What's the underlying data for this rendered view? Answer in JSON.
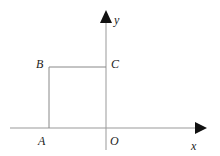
{
  "diagram": {
    "type": "coordinate-plane-square",
    "axes": {
      "x_label": "x",
      "y_label": "y",
      "origin_label": "O"
    },
    "points": [
      {
        "name": "A",
        "label": "A",
        "position": "on negative x-axis"
      },
      {
        "name": "B",
        "label": "B",
        "position": "upper-left vertex"
      },
      {
        "name": "C",
        "label": "C",
        "position": "on positive y-axis"
      },
      {
        "name": "O",
        "label": "O",
        "position": "origin"
      }
    ],
    "shape": "square ABCO",
    "colors": {
      "line": "#888888",
      "axis": "#999999",
      "arrow": "#111111",
      "text": "#222222"
    }
  }
}
